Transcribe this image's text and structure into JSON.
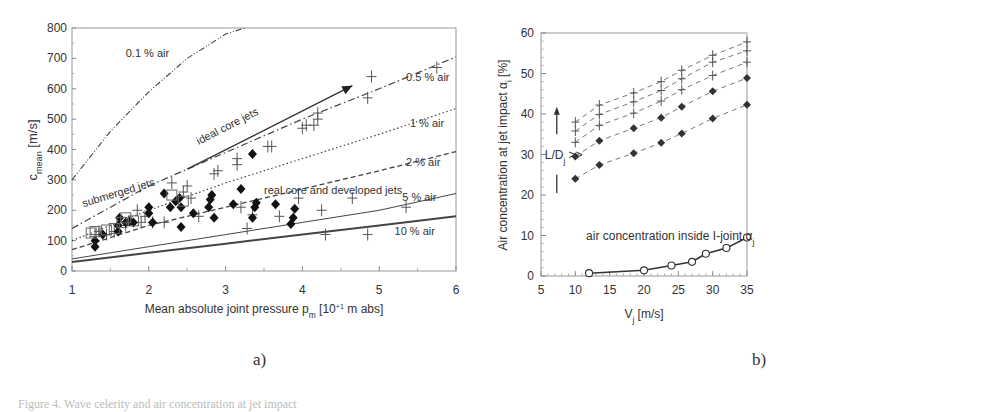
{
  "figure": {
    "panel_a_label": "a)",
    "panel_b_label": "b)",
    "caption_fragment": "Figure 4.  Wave celerity and air concentration at jet impact"
  },
  "chart_data": [
    {
      "type": "scatter",
      "panel": "a)",
      "title": "",
      "xlabel": "Mean absolute joint pressure p_m [10^+1 m abs]",
      "xlabel_main": "Mean absolute joint pressure p",
      "xlabel_sub": "m",
      "xlabel_tail": " [10",
      "xlabel_sup": "+1",
      "xlabel_end": " m abs]",
      "ylabel": "c_mean [m/s]",
      "ylabel_main": "c",
      "ylabel_sub": "mean",
      "ylabel_tail": " [m/s]",
      "xlim": [
        1,
        6
      ],
      "ylim": [
        0,
        800
      ],
      "xticks": [
        "1",
        "2",
        "3",
        "4",
        "5",
        "6"
      ],
      "yticks": [
        "0",
        "100",
        "200",
        "300",
        "400",
        "500",
        "600",
        "700",
        "800"
      ],
      "grid": false,
      "curves": [
        {
          "name": "0.1 % air",
          "style": "dash-dot-dot",
          "points": [
            [
              1.0,
              300
            ],
            [
              1.5,
              460
            ],
            [
              2.0,
              590
            ],
            [
              2.5,
              700
            ],
            [
              3.0,
              780
            ],
            [
              3.25,
              800
            ]
          ]
        },
        {
          "name": "0.5 % air",
          "style": "dash-dot",
          "points": [
            [
              1.0,
              140
            ],
            [
              2.0,
              280
            ],
            [
              3.0,
              390
            ],
            [
              4.0,
              500
            ],
            [
              5.0,
              600
            ],
            [
              6.0,
              705
            ]
          ]
        },
        {
          "name": "1 % air",
          "style": "dotted",
          "points": [
            [
              1.0,
              100
            ],
            [
              2.0,
              200
            ],
            [
              3.0,
              290
            ],
            [
              4.0,
              370
            ],
            [
              5.0,
              450
            ],
            [
              6.0,
              535
            ]
          ]
        },
        {
          "name": "2 % air",
          "style": "dashed",
          "points": [
            [
              1.0,
              70
            ],
            [
              2.0,
              150
            ],
            [
              3.0,
              210
            ],
            [
              4.0,
              270
            ],
            [
              5.0,
              330
            ],
            [
              6.0,
              393
            ]
          ]
        },
        {
          "name": "5 % air",
          "style": "solid-thin",
          "points": [
            [
              1.0,
              40
            ],
            [
              2.0,
              80
            ],
            [
              3.0,
              120
            ],
            [
              4.0,
              160
            ],
            [
              5.0,
              200
            ],
            [
              6.0,
              255
            ]
          ]
        },
        {
          "name": "10 % air",
          "style": "solid-thick",
          "points": [
            [
              1.0,
              30
            ],
            [
              2.0,
              60
            ],
            [
              3.0,
              90
            ],
            [
              4.0,
              120
            ],
            [
              5.0,
              150
            ],
            [
              6.0,
              180
            ]
          ]
        }
      ],
      "annotations": [
        {
          "text": "0.1 % air",
          "x": 1.7,
          "y": 705
        },
        {
          "text": "0.5 % air",
          "x": 5.35,
          "y": 625
        },
        {
          "text": "1 % air",
          "x": 5.4,
          "y": 475
        },
        {
          "text": "2 % air",
          "x": 5.35,
          "y": 345
        },
        {
          "text": "5 % air",
          "x": 5.3,
          "y": 230
        },
        {
          "text": "10 % air",
          "x": 5.2,
          "y": 120
        },
        {
          "text": "ideal core jets",
          "x": 2.65,
          "y": 415
        },
        {
          "text": "submerged jets",
          "x": 1.15,
          "y": 210
        },
        {
          "text": "real core and developed jets",
          "x": 3.5,
          "y": 255
        }
      ],
      "arrow": {
        "label": "ideal core jets",
        "from": [
          2.5,
          335
        ],
        "to": [
          4.65,
          610
        ]
      },
      "series": [
        {
          "name": "plus markers",
          "marker": "+",
          "points": [
            [
              1.3,
              120
            ],
            [
              1.35,
              130
            ],
            [
              1.45,
              120
            ],
            [
              1.55,
              130
            ],
            [
              1.7,
              150
            ],
            [
              1.85,
              200
            ],
            [
              1.9,
              160
            ],
            [
              1.95,
              180
            ],
            [
              2.05,
              160
            ],
            [
              2.2,
              160
            ],
            [
              2.3,
              290
            ],
            [
              2.45,
              260
            ],
            [
              2.5,
              280
            ],
            [
              2.55,
              240
            ],
            [
              2.65,
              180
            ],
            [
              2.85,
              320
            ],
            [
              2.9,
              330
            ],
            [
              3.15,
              350
            ],
            [
              3.15,
              370
            ],
            [
              3.2,
              210
            ],
            [
              3.28,
              140
            ],
            [
              3.35,
              185
            ],
            [
              3.55,
              410
            ],
            [
              3.6,
              410
            ],
            [
              3.7,
              180
            ],
            [
              3.95,
              240
            ],
            [
              4.0,
              470
            ],
            [
              4.05,
              480
            ],
            [
              4.15,
              480
            ],
            [
              4.2,
              500
            ],
            [
              4.2,
              520
            ],
            [
              4.25,
              200
            ],
            [
              4.3,
              120
            ],
            [
              4.65,
              240
            ],
            [
              4.85,
              570
            ],
            [
              4.9,
              640
            ],
            [
              4.85,
              120
            ],
            [
              5.35,
              210
            ],
            [
              5.75,
              670
            ]
          ]
        },
        {
          "name": "diamond markers",
          "marker": "diamond",
          "points": [
            [
              1.3,
              80
            ],
            [
              1.3,
              100
            ],
            [
              1.4,
              120
            ],
            [
              1.6,
              130
            ],
            [
              1.6,
              150
            ],
            [
              1.62,
              175
            ],
            [
              1.7,
              160
            ],
            [
              1.75,
              165
            ],
            [
              1.8,
              160
            ],
            [
              2.0,
              190
            ],
            [
              2.0,
              210
            ],
            [
              2.05,
              160
            ],
            [
              2.2,
              255
            ],
            [
              2.28,
              210
            ],
            [
              2.35,
              230
            ],
            [
              2.4,
              240
            ],
            [
              2.42,
              210
            ],
            [
              2.42,
              145
            ],
            [
              2.58,
              190
            ],
            [
              2.78,
              210
            ],
            [
              2.8,
              235
            ],
            [
              2.82,
              250
            ],
            [
              2.85,
              175
            ],
            [
              3.1,
              220
            ],
            [
              3.2,
              270
            ],
            [
              3.35,
              175
            ],
            [
              3.38,
              210
            ],
            [
              3.4,
              225
            ],
            [
              3.65,
              220
            ],
            [
              3.35,
              385
            ],
            [
              3.85,
              155
            ],
            [
              3.88,
              175
            ],
            [
              3.9,
              205
            ]
          ]
        },
        {
          "name": "square markers",
          "marker": "square",
          "points": [
            [
              1.25,
              125
            ],
            [
              1.3,
              130
            ],
            [
              1.45,
              135
            ],
            [
              1.55,
              140
            ],
            [
              1.65,
              160
            ],
            [
              1.7,
              175
            ],
            [
              1.8,
              165
            ],
            [
              2.3,
              250
            ],
            [
              2.45,
              230
            ]
          ]
        }
      ]
    },
    {
      "type": "line",
      "panel": "b)",
      "title": "",
      "xlabel": "V_j [m/s]",
      "xlabel_main": "V",
      "xlabel_sub": "j",
      "xlabel_tail": " [m/s]",
      "ylabel": "Air concentration at jet impact α_i [%]",
      "ylabel_main": "Air concentration at jet impact  α",
      "ylabel_sub": "i",
      "ylabel_tail": " [%]",
      "xlim": [
        5,
        35
      ],
      "ylim": [
        0,
        60
      ],
      "xticks": [
        "5",
        "10",
        "15",
        "20",
        "25",
        "30",
        "35"
      ],
      "yticks": [
        "0",
        "10",
        "20",
        "30",
        "40",
        "50",
        "60"
      ],
      "grid": false,
      "x": [
        10,
        13.5,
        18.5,
        22.5,
        25.5,
        30,
        35
      ],
      "series": [
        {
          "name": "L/D_j series 1",
          "marker": "+",
          "style": "dashed",
          "values": [
            38.0,
            42.2,
            45.2,
            48.0,
            50.8,
            54.5,
            57.8
          ]
        },
        {
          "name": "L/D_j series 2",
          "marker": "+",
          "style": "dashed",
          "values": [
            35.8,
            39.9,
            43.0,
            45.8,
            48.7,
            52.8,
            55.6
          ]
        },
        {
          "name": "L/D_j series 3",
          "marker": "+",
          "style": "dashed",
          "values": [
            33.0,
            37.2,
            40.2,
            43.2,
            46.0,
            49.5,
            52.8
          ]
        },
        {
          "name": "L/D_j series 4",
          "marker": "diamond",
          "style": "dashed",
          "values": [
            29.5,
            33.4,
            36.5,
            39.1,
            41.8,
            45.6,
            48.9
          ]
        },
        {
          "name": "L/D_j series 5",
          "marker": "diamond",
          "style": "dashed",
          "values": [
            24.0,
            27.4,
            30.3,
            32.9,
            35.2,
            38.9,
            42.3
          ]
        },
        {
          "name": "air concentration inside I-joint α_j",
          "marker": "open-circle",
          "style": "solid",
          "x": [
            12,
            20,
            24,
            27,
            29,
            32,
            35
          ],
          "values": [
            0.7,
            1.4,
            2.6,
            3.5,
            5.5,
            6.9,
            9.5
          ]
        }
      ],
      "annotations": [
        {
          "text": "L/D",
          "sub": "j",
          "tail": " >>",
          "x": 7.0,
          "y": 30
        },
        {
          "text": "air concentration inside I-joint α",
          "sub": "j",
          "x": 12,
          "y": 10
        }
      ],
      "arrow": {
        "label": "L/D_j increasing",
        "direction": "up"
      }
    }
  ]
}
